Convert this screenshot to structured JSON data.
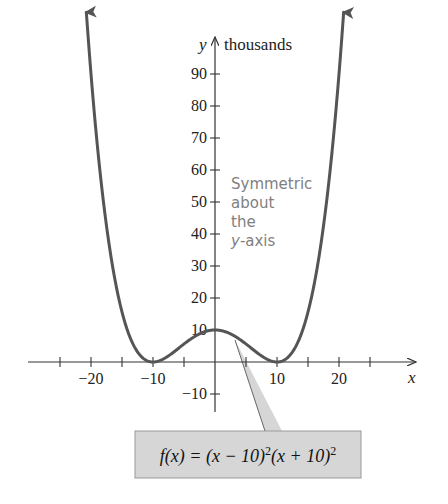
{
  "chart_data": {
    "type": "line",
    "title": "",
    "function_label": "f(x) = (x − 10)²(x + 10)²",
    "function_label_parts": {
      "lhs": "f(x) = (x − 10)",
      "exp1": "2",
      "mid": "(x + 10)",
      "exp2": "2"
    },
    "xlabel": "x",
    "ylabel": "y",
    "ylabel_units": "thousands",
    "annotation": [
      "Symmetric",
      "about",
      "the",
      "y-axis"
    ],
    "x_ticks": [
      -25,
      -20,
      -15,
      -10,
      -5,
      5,
      10,
      15,
      20,
      25
    ],
    "x_tick_labels": [
      "−20",
      "−10",
      "10",
      "20"
    ],
    "x_tick_label_values": [
      -20,
      -10,
      10,
      20
    ],
    "y_ticks": [
      -10,
      10,
      20,
      30,
      40,
      50,
      60,
      70,
      80,
      90
    ],
    "y_tick_labels": [
      "−10",
      "10",
      "20",
      "30",
      "40",
      "50",
      "60",
      "70",
      "80",
      "90"
    ],
    "xlim": [
      -30,
      32
    ],
    "ylim": [
      -15,
      102
    ],
    "grid": false,
    "series": [
      {
        "name": "f(x) = (x - 10)^2 (x + 10)^2",
        "x": [
          -20.5,
          -20,
          -18,
          -16,
          -14,
          -12,
          -10,
          -8,
          -6,
          -4,
          -2,
          0,
          2,
          4,
          6,
          8,
          10,
          12,
          14,
          16,
          18,
          20,
          20.5
        ],
        "y": [
          102.3,
          90,
          50.4,
          24.3,
          9.2,
          1.9,
          0,
          1.3,
          4.1,
          7.1,
          9.2,
          10,
          9.2,
          7.1,
          4.1,
          1.3,
          0,
          1.9,
          9.2,
          24.3,
          50.4,
          90,
          102.3
        ]
      }
    ],
    "key_points": [
      {
        "x": -10,
        "y": 0,
        "label": "zero"
      },
      {
        "x": 0,
        "y": 10,
        "label": "local max"
      },
      {
        "x": 10,
        "y": 0,
        "label": "zero"
      }
    ],
    "colors": {
      "curve": "#555555",
      "axis": "#333333",
      "callout_fill": "#d6d6d6",
      "callout_border": "#9a9a9a",
      "annotation_text": "#808080"
    }
  }
}
